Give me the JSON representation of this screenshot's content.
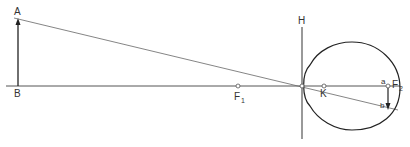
{
  "diagram": {
    "labels": {
      "A": "A",
      "B": "B",
      "H": "H",
      "F1": "F",
      "F1_sub": "1",
      "K": "K",
      "F2": "F",
      "F2_sub": "2",
      "a": "a",
      "b": "b"
    },
    "colors": {
      "line": "#444444",
      "text": "#333333",
      "background": "#ffffff"
    }
  }
}
